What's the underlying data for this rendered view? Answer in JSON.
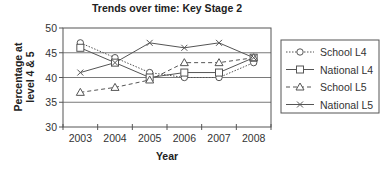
{
  "chart_data": {
    "type": "line",
    "title": "Trends over time: Key Stage 2",
    "xlabel": "Year",
    "ylabel": [
      "Percentage at",
      "level 4 & 5"
    ],
    "categories": [
      "2003",
      "2004",
      "2005",
      "2006",
      "2007",
      "2008"
    ],
    "ylim": [
      30,
      50
    ],
    "yticks": [
      30,
      35,
      40,
      45,
      50
    ],
    "grid": "horizontal",
    "legend_position": "right",
    "series": [
      {
        "name": "School L4",
        "marker": "circle",
        "line": "dotted",
        "values": [
          47,
          44,
          41,
          40,
          40,
          43
        ]
      },
      {
        "name": "National L4",
        "marker": "square",
        "line": "solid",
        "values": [
          46,
          43,
          40,
          41,
          41,
          44
        ]
      },
      {
        "name": "School L5",
        "marker": "triangle",
        "line": "dashed",
        "values": [
          37,
          38,
          39.5,
          43,
          43,
          44
        ]
      },
      {
        "name": "National L5",
        "marker": "x",
        "line": "solid",
        "values": [
          41,
          43,
          47,
          46,
          47,
          44
        ]
      }
    ]
  },
  "colors": {
    "line": "#555555",
    "grid": "#7a7a7a",
    "axis": "#555555"
  }
}
